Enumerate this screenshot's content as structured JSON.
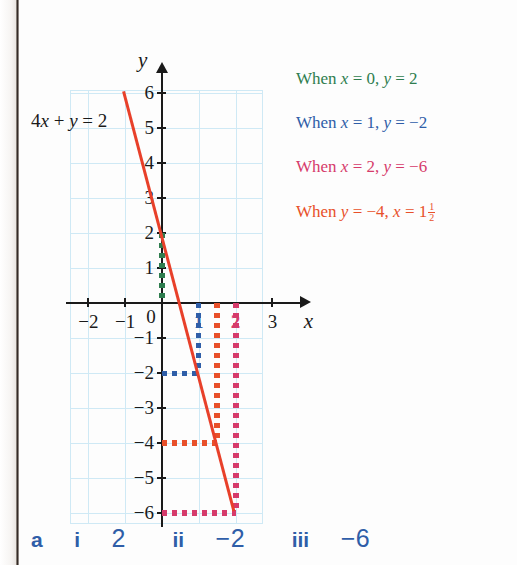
{
  "figure": {
    "equation_label": "4x + y = 2",
    "x_axis_name": "x",
    "y_axis_name": "y",
    "x_tick_labels": [
      "−2",
      "−1",
      "0",
      "1",
      "2",
      "3"
    ],
    "y_tick_labels": [
      "6",
      "5",
      "4",
      "3",
      "2",
      "1",
      "−1",
      "−2",
      "−3",
      "−4",
      "−5",
      "−6"
    ]
  },
  "legend": {
    "items": [
      {
        "text": "When x = 0, y = 2",
        "color": "#2f7d4f"
      },
      {
        "text": "When x = 1, y = −2",
        "color": "#2f5ea8"
      },
      {
        "text": "When x = 2, y = −6",
        "color": "#d63b6b"
      },
      {
        "text": "When y = −4, x = 1",
        "fraction_num": "1",
        "fraction_den": "2",
        "color": "#e8502a"
      }
    ]
  },
  "answers": {
    "part": "a",
    "items": [
      {
        "numeral": "i",
        "value": "2"
      },
      {
        "numeral": "ii",
        "value": "−2"
      },
      {
        "numeral": "iii",
        "value": "−6"
      }
    ]
  },
  "colors": {
    "function_line": "#e8402a",
    "grid": "#cfe9f5",
    "axis": "#1a1a1a",
    "green": "#2f7d4f",
    "blue": "#2f5ea8",
    "pink": "#d63b6b",
    "orange": "#e8502a"
  },
  "chart_data": {
    "type": "line",
    "title": "",
    "xlabel": "x",
    "ylabel": "y",
    "xlim": [
      -2.5,
      3.5
    ],
    "ylim": [
      -6.5,
      6.5
    ],
    "grid": true,
    "legend_position": "right",
    "series": [
      {
        "name": "4x + y = 2",
        "color": "#e8402a",
        "equation": "y = 2 - 4x",
        "x": [
          -1,
          2
        ],
        "y": [
          6,
          -6
        ]
      }
    ],
    "annotations": [
      {
        "label": "When x = 0, y = 2",
        "x": 0,
        "y": 2,
        "color": "#2f7d4f",
        "guide": "vertical from (0,0) to (0,2)"
      },
      {
        "label": "When x = 1, y = −2",
        "x": 1,
        "y": -2,
        "color": "#2f5ea8",
        "guide": "vertical x=1 to y=-2 plus horizontal to y-axis"
      },
      {
        "label": "When x = 2, y = −6",
        "x": 2,
        "y": -6,
        "color": "#d63b6b",
        "guide": "vertical x=2 to y=-6 plus horizontal to y-axis"
      },
      {
        "label": "When y = −4, x = 1 1/2",
        "x": 1.5,
        "y": -4,
        "color": "#e8502a",
        "guide": "vertical x=1.5 to y=-4 plus horizontal to y-axis"
      }
    ],
    "xticks": [
      -2,
      -1,
      0,
      1,
      2,
      3
    ],
    "yticks": [
      -6,
      -5,
      -4,
      -3,
      -2,
      -1,
      1,
      2,
      3,
      4,
      5,
      6
    ]
  }
}
